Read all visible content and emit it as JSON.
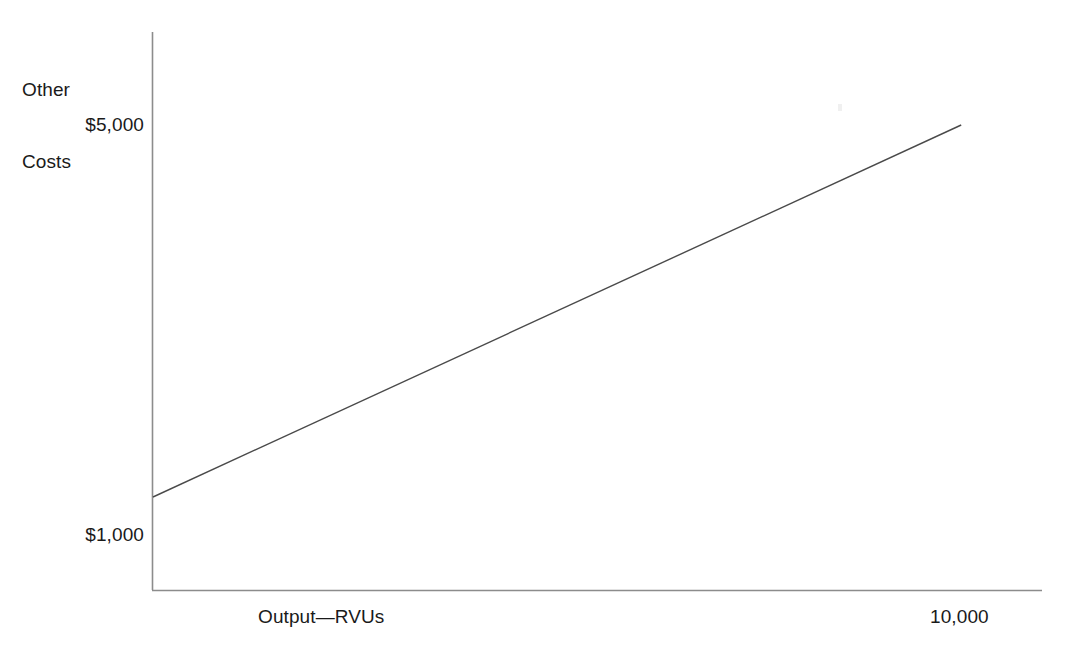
{
  "chart_data": {
    "type": "line",
    "title": "",
    "xlabel": "Output—RVUs",
    "ylabel": "Other Costs",
    "ylabel_lines": [
      "Other",
      "Costs"
    ],
    "x_tick_labels": [
      "10,000"
    ],
    "x_tick_values": [
      10000
    ],
    "y_tick_labels": [
      "$5,000",
      "$1,000"
    ],
    "y_tick_values": [
      5000,
      1000
    ],
    "xlim": [
      0,
      11000
    ],
    "ylim": [
      0,
      6000
    ],
    "grid": false,
    "legend": null,
    "series": [
      {
        "name": "Other Costs",
        "style": "solid-thin",
        "color": "#4a4a4a",
        "x": [
          0,
          10000
        ],
        "values": [
          1000,
          5000
        ],
        "description": "Mixed cost line: fixed component $1,000 at zero output rising linearly to $5,000 at 10,000 RVUs"
      }
    ],
    "annotations": []
  },
  "figure": {
    "y_axis_label": "Other\nCosts",
    "y_axis_label_line1": "Other",
    "y_axis_label_line2": "Costs",
    "y_tick_top": "$5,000",
    "y_tick_bottom": "$1,000",
    "x_axis_label": "Output—RVUs",
    "x_tick_right": "10,000",
    "axis_color": "#8c8c8c",
    "line_color": "#4a4a4a",
    "background_color": "#ffffff",
    "text_color": "#1a1a1a"
  }
}
